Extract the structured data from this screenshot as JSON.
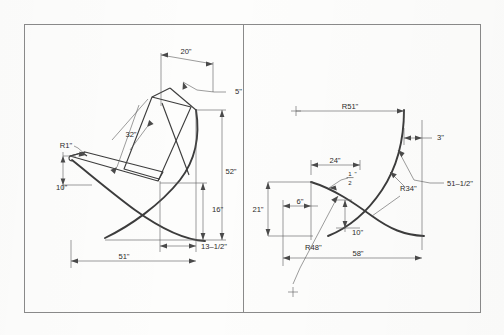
{
  "document": {
    "title": "Chair Dimensioned Drawing",
    "kind": "technical-drawing",
    "panel_count": 2,
    "line_color": "#3a3a3a",
    "frame_color": "#7a7a7a",
    "paper_color": "#fdfdfc"
  },
  "left_panel": {
    "name": "side-elevation",
    "dimensions": [
      {
        "id": "top-width",
        "label": "20\"",
        "kind": "linear"
      },
      {
        "id": "back-thickness",
        "label": "5\"",
        "kind": "linear-leader"
      },
      {
        "id": "back-length",
        "label": "32\"",
        "kind": "linear-aligned"
      },
      {
        "id": "arm-radius",
        "label": "R1\"",
        "kind": "radius-leader"
      },
      {
        "id": "seat-front-rise",
        "label": "10\"",
        "kind": "linear"
      },
      {
        "id": "overall-height",
        "label": "52\"",
        "kind": "linear"
      },
      {
        "id": "seat-height",
        "label": "16\"",
        "kind": "linear"
      },
      {
        "id": "rear-offset",
        "label": "13–1/2\"",
        "kind": "linear"
      },
      {
        "id": "overall-depth",
        "label": "51\"",
        "kind": "linear"
      }
    ]
  },
  "right_panel": {
    "name": "frame-curve-geometry",
    "dimensions": [
      {
        "id": "upper-radius",
        "label": "R51\"",
        "kind": "radius"
      },
      {
        "id": "top-offset",
        "label": "3\"",
        "kind": "linear"
      },
      {
        "id": "chord-length",
        "label": "51–1/2\"",
        "kind": "linear-leader"
      },
      {
        "id": "mid-radius",
        "label": "R34\"",
        "kind": "radius-leader"
      },
      {
        "id": "upper-span",
        "label": "24\"",
        "kind": "linear"
      },
      {
        "id": "left-height",
        "label": "21\"",
        "kind": "linear"
      },
      {
        "id": "left-offset",
        "label": "6\"",
        "kind": "linear"
      },
      {
        "id": "cross-gap",
        "label": "10\"",
        "kind": "linear"
      },
      {
        "id": "lower-radius",
        "label": "R48\"",
        "kind": "radius-leader"
      },
      {
        "id": "overall-span",
        "label": "58\"",
        "kind": "linear"
      }
    ],
    "stacked_fraction": {
      "numerator": "1",
      "denominator": "2",
      "unit": "\""
    }
  }
}
